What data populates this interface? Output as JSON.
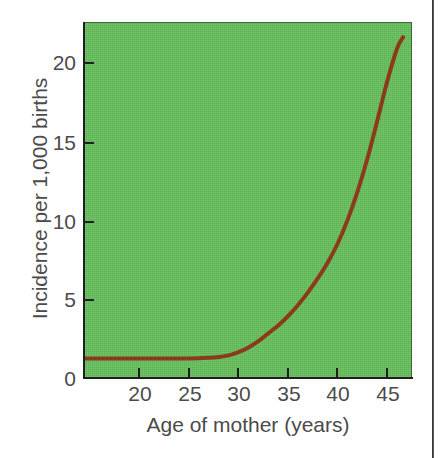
{
  "chart_data": {
    "type": "line",
    "title": "",
    "subtitle": "",
    "xlabel": "Age of mother (years)",
    "ylabel": "Incidence per 1,000 births",
    "xlim": [
      15.5,
      48.6
    ],
    "ylim": [
      0,
      22.6
    ],
    "xticks": [
      20,
      25,
      30,
      35,
      40,
      45
    ],
    "xtick_labels": [
      "20",
      "25",
      "30",
      "35",
      "40",
      "45"
    ],
    "yticks": [
      0,
      5,
      10,
      15,
      20
    ],
    "ytick_labels": [
      "0",
      "5",
      "10",
      "15",
      "20"
    ],
    "grid": false,
    "legend": null,
    "plot_background_color": "#63bf5a",
    "axis_color": "#1f1f1f",
    "tick_label_color": "#4b4b4b",
    "series": [
      {
        "name": "Incidence",
        "color": "#8b3a1e",
        "line_width": 4,
        "x": [
          15.5,
          18,
          20,
          22,
          24,
          26,
          28,
          29,
          30,
          31,
          32,
          33,
          34,
          35,
          36,
          37,
          38,
          39,
          40,
          41,
          42,
          43,
          44,
          45,
          46,
          47,
          47.6
        ],
        "y": [
          1.3,
          1.3,
          1.3,
          1.3,
          1.3,
          1.3,
          1.35,
          1.4,
          1.5,
          1.7,
          2.0,
          2.4,
          2.9,
          3.4,
          4.0,
          4.7,
          5.5,
          6.4,
          7.4,
          8.6,
          10.1,
          11.9,
          14.0,
          16.4,
          18.9,
          21.0,
          21.7
        ]
      }
    ],
    "annotations": []
  },
  "figure": {
    "x_axis_title": "Age of mother (years)",
    "y_axis_title": "Incidence per 1,000 births",
    "x_tick_labels": [
      "20",
      "25",
      "30",
      "35",
      "40",
      "45"
    ],
    "y_tick_labels": [
      "20",
      "15",
      "10",
      "5",
      "0"
    ]
  }
}
